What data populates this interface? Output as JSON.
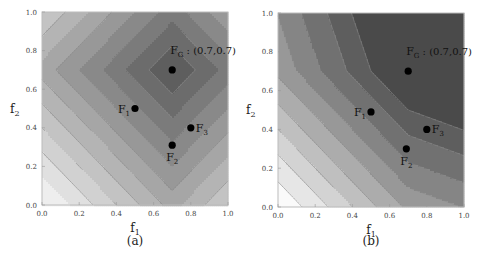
{
  "chart_data": [
    {
      "type": "heatmap",
      "subtype": "contour",
      "caption": "(a)",
      "xlabel": "f1",
      "ylabel": "f2",
      "xlim": [
        0,
        1
      ],
      "ylim": [
        0,
        1
      ],
      "xticks": [
        "0.0",
        "0.2",
        "0.4",
        "0.6",
        "0.8",
        "1.0"
      ],
      "yticks": [
        "0.0",
        "0.2",
        "0.4",
        "0.6",
        "0.8",
        "1.0"
      ],
      "function": "L1 distance to (0.7,0.7): |f1-0.7|+|f2-0.7|",
      "contour_levels": [
        0.125,
        0.25,
        0.375,
        0.5,
        0.625,
        0.75,
        0.875,
        1.0,
        1.125,
        1.25
      ],
      "colormap": [
        "#5e5e5e",
        "#eeeeee"
      ],
      "points": [
        {
          "label": "F",
          "sub": "G",
          "suffix": " : (0.7,0.7)",
          "x": 0.7,
          "y": 0.7,
          "label_pos": "above",
          "label_color": "#ffffff"
        },
        {
          "label": "F",
          "sub": "1",
          "suffix": "",
          "x": 0.5,
          "y": 0.5,
          "label_pos": "left",
          "label_color": "#111111"
        },
        {
          "label": "F",
          "sub": "2",
          "suffix": "",
          "x": 0.7,
          "y": 0.31,
          "label_pos": "below",
          "label_color": "#111111"
        },
        {
          "label": "F",
          "sub": "3",
          "suffix": "",
          "x": 0.8,
          "y": 0.4,
          "label_pos": "right",
          "label_color": "#111111"
        }
      ]
    },
    {
      "type": "heatmap",
      "subtype": "contour",
      "caption": "(b)",
      "xlabel": "f1",
      "ylabel": "f2",
      "xlim": [
        0,
        1
      ],
      "ylim": [
        0,
        1
      ],
      "xticks": [
        "0.0",
        "0.2",
        "0.4",
        "0.6",
        "0.8",
        "1.0"
      ],
      "yticks": [
        "0.0",
        "0.2",
        "0.4",
        "0.6",
        "0.8",
        "1.0"
      ],
      "function": "piecewise-linear achievement function toward (0.7,0.7)",
      "contour_levels": [
        0.2,
        0.33,
        0.47,
        0.6,
        0.73,
        0.87,
        1.0,
        1.13,
        1.27
      ],
      "colormap": [
        "#4a4a4a",
        "#fafafa"
      ],
      "points": [
        {
          "label": "F",
          "sub": "G",
          "suffix": " : (0.7,0.7)",
          "x": 0.7,
          "y": 0.7,
          "label_pos": "above",
          "label_color": "#111111"
        },
        {
          "label": "F",
          "sub": "1",
          "suffix": "",
          "x": 0.5,
          "y": 0.49,
          "label_pos": "left",
          "label_color": "#111111"
        },
        {
          "label": "F",
          "sub": "2",
          "suffix": "",
          "x": 0.69,
          "y": 0.3,
          "label_pos": "below",
          "label_color": "#111111"
        },
        {
          "label": "F",
          "sub": "3",
          "suffix": "",
          "x": 0.8,
          "y": 0.4,
          "label_pos": "right",
          "label_color": "#111111"
        }
      ]
    }
  ]
}
